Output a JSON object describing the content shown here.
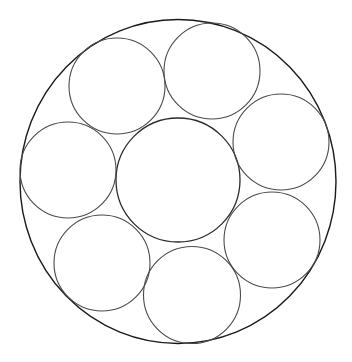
{
  "diagram": {
    "type": "circle-packing",
    "canvas": {
      "width": 352,
      "height": 362,
      "background": "#ffffff"
    },
    "colors": {
      "outer_stroke": "#1a1a1a",
      "center_stroke": "#2a2a2a",
      "inner_stroke": "#4a4a4a"
    },
    "outer_circle": {
      "cx": 178,
      "cy": 181.5,
      "rx": 158,
      "ry": 162
    },
    "center_circle": {
      "cx": 178,
      "cy": 180,
      "r": 62
    },
    "small_circles": [
      {
        "name": "top-left",
        "cx": 117,
        "cy": 86,
        "r": 48
      },
      {
        "name": "top-right",
        "cx": 212,
        "cy": 71,
        "r": 48
      },
      {
        "name": "right",
        "cx": 281,
        "cy": 142,
        "r": 48
      },
      {
        "name": "bottom-right",
        "cx": 272,
        "cy": 240,
        "r": 48
      },
      {
        "name": "bottom",
        "cx": 192,
        "cy": 295,
        "r": 48.5
      },
      {
        "name": "bottom-left",
        "cx": 102,
        "cy": 263,
        "r": 48
      },
      {
        "name": "left",
        "cx": 68,
        "cy": 170,
        "r": 48
      }
    ]
  }
}
